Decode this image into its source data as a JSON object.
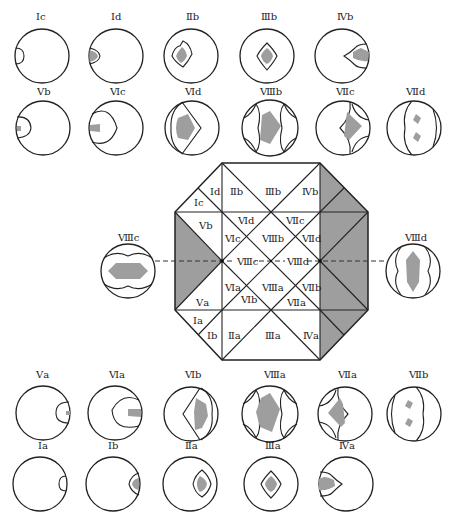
{
  "diagram": {
    "type": "stereographic-projection-zone-diagram",
    "colors": {
      "line": "#222222",
      "fill": "#9e9e9e",
      "background": "#ffffff"
    },
    "top_row_1": [
      {
        "label": "Ⅰc"
      },
      {
        "label": "Ⅰd"
      },
      {
        "label": "Ⅱb"
      },
      {
        "label": "Ⅲb"
      },
      {
        "label": "Ⅳb"
      }
    ],
    "top_row_2": [
      {
        "label": "Ⅴb"
      },
      {
        "label": "Ⅵc"
      },
      {
        "label": "Ⅵd"
      },
      {
        "label": "Ⅷb"
      },
      {
        "label": "Ⅶc"
      },
      {
        "label": "Ⅶd"
      }
    ],
    "side": {
      "left": {
        "label": "Ⅷc"
      },
      "right": {
        "label": "Ⅷd"
      }
    },
    "bottom_row_1": [
      {
        "label": "Ⅴa"
      },
      {
        "label": "Ⅵa"
      },
      {
        "label": "Ⅵb"
      },
      {
        "label": "Ⅷa"
      },
      {
        "label": "Ⅶa"
      },
      {
        "label": "Ⅶb"
      }
    ],
    "bottom_row_2": [
      {
        "label": "Ⅰa"
      },
      {
        "label": "Ⅰb"
      },
      {
        "label": "Ⅱa"
      },
      {
        "label": "Ⅲa"
      },
      {
        "label": "Ⅳa"
      }
    ],
    "octagon_labels": {
      "Ic": "Ⅰc",
      "Id": "Ⅰd",
      "IIb": "Ⅱb",
      "IIIb": "Ⅲb",
      "IVb": "Ⅳb",
      "Vb": "Ⅴb",
      "VId": "Ⅵd",
      "VIc": "Ⅵc",
      "VIIIb": "Ⅷb",
      "VIIc": "Ⅶc",
      "VIId": "Ⅶd",
      "VIIIc": "Ⅷc",
      "VIIId": "Ⅷd",
      "VIa": "Ⅵa",
      "VIIIa_top": "Ⅷa",
      "VIIb": "Ⅶb",
      "Va": "Ⅴa",
      "VIb": "Ⅵb",
      "VIIa": "Ⅶa",
      "Ia": "Ⅰa",
      "Ib": "Ⅰb",
      "IIa": "Ⅱa",
      "IIIa": "Ⅲa",
      "IVa": "Ⅳa"
    }
  }
}
